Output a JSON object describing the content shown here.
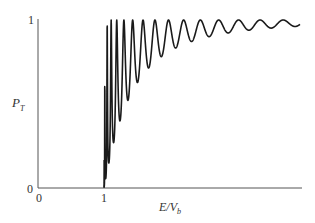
{
  "chart_data": {
    "type": "line",
    "title": "",
    "xlabel": "E/V_b",
    "ylabel": "P_T",
    "x_ticks": [
      {
        "value": 0,
        "label": "0"
      },
      {
        "value": 1,
        "label": "1"
      }
    ],
    "y_ticks": [
      {
        "value": 0,
        "label": "0"
      },
      {
        "value": 1,
        "label": "1"
      }
    ],
    "xlim": [
      0,
      4
    ],
    "ylim": [
      0,
      1
    ],
    "grid": false,
    "legend": null,
    "series": [
      {
        "name": "P_T",
        "description": "Transmission probability over a square barrier: zero for E/V_b < 1, rising sharply at E/V_b = 1 with rapid oscillations whose amplitude decays and period lengthens, approaching 1.",
        "x": [
          1.0,
          1.02,
          1.04,
          1.06,
          1.08,
          1.1,
          1.15,
          1.2,
          1.3,
          1.4,
          1.6,
          1.8,
          2.0,
          2.4,
          2.8,
          3.2,
          3.6,
          3.9
        ],
        "y_minima_envelope": [
          0.0,
          0.05,
          0.15,
          0.3,
          0.45,
          0.58,
          0.66,
          0.74,
          0.8,
          0.86,
          0.9,
          0.92,
          0.94,
          0.95,
          0.96,
          0.97,
          0.97,
          0.97
        ],
        "y_maxima": 1.0
      }
    ]
  },
  "axes": {
    "x_label": "E/V",
    "x_label_sub": "b",
    "y_label": "P",
    "y_label_sub": "T",
    "origin_x_label": "0",
    "origin_y_label": "0",
    "tick_x_1": "1",
    "tick_y_1": "1"
  },
  "colors": {
    "axis": "#555555",
    "curve": "#1a1a1a"
  }
}
